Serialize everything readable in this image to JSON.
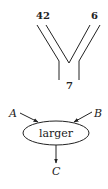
{
  "top_diagram": {
    "left_input_label": "42",
    "right_input_label": "6",
    "output_label": "7"
  },
  "bottom_diagram": {
    "node_label": "larger",
    "input_a": "A",
    "input_b": "B",
    "output_c": "C"
  },
  "colors": {
    "stroke": "#222222",
    "background": "#ffffff"
  }
}
